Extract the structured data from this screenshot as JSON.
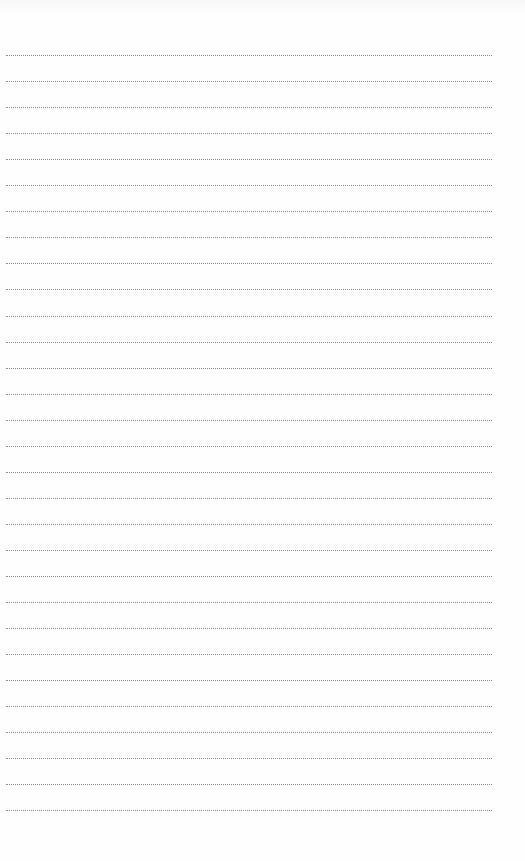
{
  "page": {
    "type": "lined-paper",
    "background_color": "#fefefe",
    "line_color": "#8c8c8c",
    "line_style": "dotted",
    "line_count": 30,
    "first_line_y": 55,
    "line_spacing": 26.05,
    "line_left": 6,
    "line_width": 486
  }
}
